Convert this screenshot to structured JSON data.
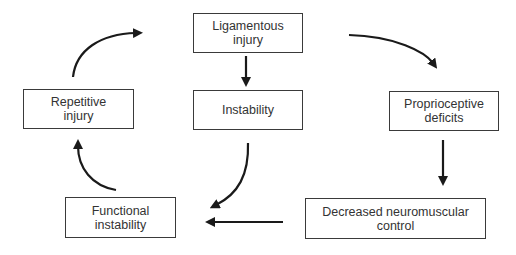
{
  "diagram": {
    "type": "cycle-flowchart",
    "colors": {
      "stroke": "#1a1a1a",
      "box_border": "#3a3a3a",
      "text": "#333333",
      "background": "#ffffff"
    },
    "nodes": {
      "ligamentous_injury": {
        "line1": "Ligamentous",
        "line2": "injury"
      },
      "instability": {
        "line1": "Instability"
      },
      "proprioceptive_deficits": {
        "line1": "Proprioceptive",
        "line2": "deficits"
      },
      "repetitive_injury": {
        "line1": "Repetitive",
        "line2": "injury"
      },
      "functional_instability": {
        "line1": "Functional",
        "line2": "instability"
      },
      "decreased_neuromuscular_control": {
        "line1": "Decreased neuromuscular",
        "line2": "control"
      }
    },
    "edges": [
      {
        "from": "Ligamentous injury",
        "to": "Instability"
      },
      {
        "from": "Ligamentous injury",
        "to": "Proprioceptive deficits"
      },
      {
        "from": "Proprioceptive deficits",
        "to": "Decreased neuromuscular control"
      },
      {
        "from": "Decreased neuromuscular control",
        "to": "Functional instability"
      },
      {
        "from": "Instability",
        "to": "Functional instability"
      },
      {
        "from": "Functional instability",
        "to": "Repetitive injury"
      },
      {
        "from": "Repetitive injury",
        "to": "Ligamentous injury"
      }
    ]
  }
}
